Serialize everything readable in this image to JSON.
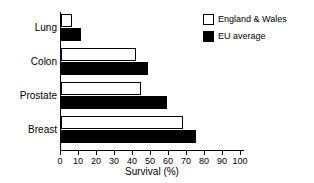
{
  "chart_data": {
    "type": "bar",
    "orientation": "horizontal",
    "title": "",
    "xlabel": "Survival (%)",
    "ylabel": "",
    "xlim": [
      0,
      100
    ],
    "xticks": [
      0,
      10,
      20,
      30,
      40,
      50,
      60,
      70,
      80,
      90,
      100
    ],
    "grid": false,
    "legend_position": "top-right",
    "categories": [
      "Lung",
      "Colon",
      "Prostate",
      "Breast"
    ],
    "series": [
      {
        "name": "England & Wales",
        "style": "open",
        "color": "#ffffff",
        "edge_color": "#000000",
        "values": [
          6,
          41,
          44,
          67
        ]
      },
      {
        "name": "EU average",
        "style": "filled",
        "color": "#000000",
        "edge_color": "#000000",
        "values": [
          11,
          48,
          58,
          74
        ]
      }
    ]
  },
  "legend": {
    "items": [
      {
        "label": "England & Wales",
        "swatch": "open"
      },
      {
        "label": "EU average",
        "swatch": "filled"
      }
    ]
  },
  "axis": {
    "x_title": "Survival (%)",
    "x_tick_labels": [
      "0",
      "10",
      "20",
      "30",
      "40",
      "50",
      "60",
      "70",
      "80",
      "90",
      "100"
    ],
    "y_tick_labels": [
      "Lung",
      "Colon",
      "Prostate",
      "Breast"
    ]
  }
}
